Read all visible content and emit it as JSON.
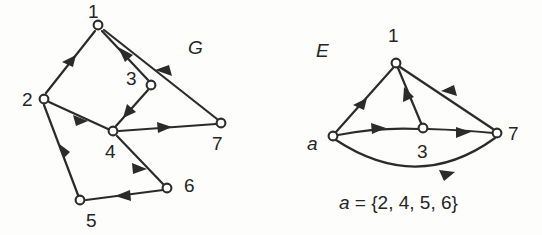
{
  "figure": {
    "background_color": "#fdfdfc",
    "ink_color": "#2b2b2b"
  },
  "left_graph": {
    "name": "G",
    "label": "G",
    "label_style": "italic",
    "nodes": [
      {
        "id": "1",
        "label": "1",
        "x": 98,
        "y": 25,
        "label_x": 88,
        "label_y": 18
      },
      {
        "id": "2",
        "label": "2",
        "x": 44,
        "y": 99,
        "label_x": 22,
        "label_y": 106
      },
      {
        "id": "3",
        "label": "3",
        "x": 151,
        "y": 85,
        "label_x": 126,
        "label_y": 85
      },
      {
        "id": "4",
        "label": "4",
        "x": 113,
        "y": 131,
        "label_x": 105,
        "label_y": 158
      },
      {
        "id": "5",
        "label": "5",
        "x": 80,
        "y": 200,
        "label_x": 86,
        "label_y": 227
      },
      {
        "id": "6",
        "label": "6",
        "x": 167,
        "y": 188,
        "label_x": 184,
        "label_y": 192
      },
      {
        "id": "7",
        "label": "7",
        "x": 221,
        "y": 123,
        "label_x": 212,
        "label_y": 150
      }
    ],
    "edges": [
      {
        "from": "2",
        "to": "1",
        "arrow_at": 0.62
      },
      {
        "from": "3",
        "to": "1",
        "arrow_at": 0.6
      },
      {
        "from": "7",
        "to": "1",
        "arrow_at": 0.45
      },
      {
        "from": "4",
        "to": "3",
        "arrow_at": 0.52
      },
      {
        "from": "2",
        "to": "4",
        "arrow_at": 0.55
      },
      {
        "from": "4",
        "to": "7",
        "arrow_at": 0.58
      },
      {
        "from": "5",
        "to": "2",
        "arrow_at": 0.55
      },
      {
        "from": "4",
        "to": "6",
        "arrow_at": 0.58
      },
      {
        "from": "6",
        "to": "5",
        "arrow_at": 0.55
      }
    ]
  },
  "right_graph": {
    "name": "E",
    "label": "E",
    "label_style": "italic",
    "nodes": [
      {
        "id": "1",
        "label": "1",
        "x": 396,
        "y": 63,
        "label_x": 388,
        "label_y": 42
      },
      {
        "id": "a",
        "label": "a",
        "x": 333,
        "y": 136,
        "label_x": 307,
        "label_y": 150,
        "label_style": "italic"
      },
      {
        "id": "3",
        "label": "3",
        "x": 423,
        "y": 128,
        "label_x": 417,
        "label_y": 158
      },
      {
        "id": "7",
        "label": "7",
        "x": 497,
        "y": 133,
        "label_x": 508,
        "label_y": 140
      }
    ],
    "edges": [
      {
        "from": "a",
        "to": "1",
        "arrow_at": 0.5,
        "curve": "straight"
      },
      {
        "from": "3",
        "to": "1",
        "arrow_at": 0.55,
        "curve": "straight"
      },
      {
        "from": "7",
        "to": "1",
        "arrow_at": 0.48,
        "curve": "straight"
      },
      {
        "from": "a",
        "to": "3",
        "arrow_at": 0.5,
        "curve": "slight-arc"
      },
      {
        "from": "3",
        "to": "7",
        "arrow_at": 0.58,
        "curve": "slight-arc"
      },
      {
        "from": "a",
        "to": "7",
        "arrow_at": 0.66,
        "curve": "deep-arc-below"
      }
    ],
    "equation": "a = {2, 4, 5, 6}",
    "equation_parts": {
      "variable": "a",
      "operator": " = ",
      "set": "{2, 4, 5, 6}"
    },
    "equation_set_members": [
      "2",
      "4",
      "5",
      "6"
    ]
  }
}
